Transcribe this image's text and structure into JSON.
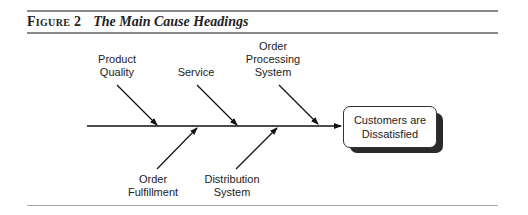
{
  "figure": {
    "label": "Figure 2",
    "caption": "The Main Cause Headings"
  },
  "diagram": {
    "type": "fishbone",
    "effect": "Customers are Dissatisfied",
    "effect_lines": [
      "Customers are",
      "Dissatisfied"
    ],
    "causes_top": [
      {
        "name": "Product Quality",
        "lines": [
          "Product",
          "Quality"
        ]
      },
      {
        "name": "Service",
        "lines": [
          "Service"
        ]
      },
      {
        "name": "Order Processing System",
        "lines": [
          "Order",
          "Processing",
          "System"
        ]
      }
    ],
    "causes_bottom": [
      {
        "name": "Order Fulfillment",
        "lines": [
          "Order",
          "Fulfillment"
        ]
      },
      {
        "name": "Distribution System",
        "lines": [
          "Distribution",
          "System"
        ]
      }
    ]
  }
}
